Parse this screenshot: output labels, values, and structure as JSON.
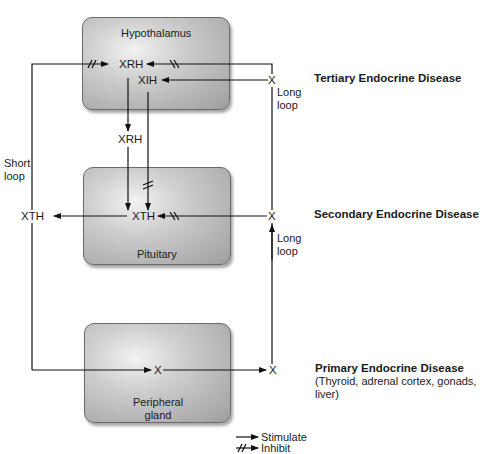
{
  "boxes": {
    "hypothalamus": "Hypothalamus",
    "pituitary": "Pituitary",
    "peripheral_line1": "Peripheral",
    "peripheral_line2": "gland"
  },
  "nodes": {
    "hyp_xrh": "XRH",
    "hyp_xih": "XIH",
    "mid_xrh": "XRH",
    "pit_xth": "XTH",
    "left_xth": "XTH",
    "right_x_top": "X",
    "right_x_mid": "X",
    "right_x_bottom": "X",
    "periph_x": "X"
  },
  "loops": {
    "short_line1": "Short",
    "short_line2": "loop",
    "long_top_line1": "Long",
    "long_top_line2": "loop",
    "long_mid_line1": "Long",
    "long_mid_line2": "loop"
  },
  "diseases": {
    "tertiary": "Tertiary Endocrine Disease",
    "secondary": "Secondary Endocrine Disease",
    "primary": "Primary Endocrine Disease",
    "primary_note_line1": "(Thyroid, adrenal cortex, gonads,",
    "primary_note_line2": "liver)"
  },
  "legend": {
    "stimulate": "Stimulate",
    "inhibit": "Inhibit"
  },
  "colors": {
    "line": "#111111",
    "box_border": "#6a6a6a"
  }
}
